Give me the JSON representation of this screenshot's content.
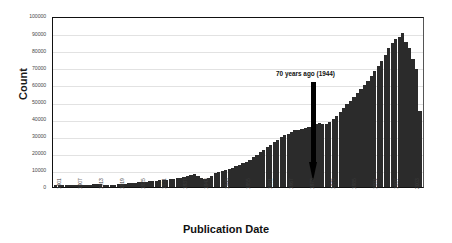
{
  "chart_data": {
    "type": "bar",
    "title": "",
    "xlabel": "Publication Date",
    "ylabel": "Count",
    "ylim": [
      0,
      100000
    ],
    "ytick_labels": [
      "100000",
      "90000",
      "80000",
      "70000",
      "60000",
      "50000",
      "40000",
      "30000",
      "20000",
      "10000",
      "0"
    ],
    "ytick_values": [
      100000,
      90000,
      80000,
      70000,
      60000,
      50000,
      40000,
      30000,
      20000,
      10000,
      0
    ],
    "grid": true,
    "legend": "none",
    "xtick_labels": [
      "1901",
      "1907",
      "1913",
      "1919",
      "1925",
      "1931",
      "1937",
      "1943",
      "1949",
      "1955",
      "1961",
      "1967",
      "1973",
      "1979",
      "1985",
      "1991",
      "1997",
      "2003"
    ],
    "xtick_step": 6,
    "annotations": [
      {
        "text": "70 years ago (1944)",
        "points_to_year": 1944,
        "arrow": "down"
      }
    ],
    "categories": [
      1901,
      1902,
      1903,
      1904,
      1905,
      1906,
      1907,
      1908,
      1909,
      1910,
      1911,
      1912,
      1913,
      1914,
      1915,
      1916,
      1917,
      1918,
      1919,
      1920,
      1921,
      1922,
      1923,
      1924,
      1925,
      1926,
      1927,
      1928,
      1929,
      1930,
      1931,
      1932,
      1933,
      1934,
      1935,
      1936,
      1937,
      1938,
      1939,
      1940,
      1941,
      1942,
      1943,
      1944,
      1945,
      1946,
      1947,
      1948,
      1949,
      1950,
      1951,
      1952,
      1953,
      1954,
      1955,
      1956,
      1957,
      1958,
      1959,
      1960,
      1961,
      1962,
      1963,
      1964,
      1965,
      1966,
      1967,
      1968,
      1969,
      1970,
      1971,
      1972,
      1973,
      1974,
      1975,
      1976,
      1977,
      1978,
      1979,
      1980,
      1981,
      1982,
      1983,
      1984,
      1985,
      1986,
      1987,
      1988,
      1989,
      1990,
      1991,
      1992,
      1993,
      1994,
      1995,
      1996,
      1997,
      1998,
      1999,
      2000,
      2001,
      2002,
      2003,
      2004,
      2005,
      2006
    ],
    "values": [
      1000,
      1050,
      1100,
      1150,
      1200,
      1200,
      1250,
      1300,
      1350,
      1400,
      1450,
      1500,
      1550,
      1500,
      1450,
      1400,
      1400,
      1450,
      1600,
      1800,
      2000,
      2200,
      2400,
      2600,
      2800,
      3000,
      3200,
      3400,
      3600,
      3800,
      4000,
      4200,
      4400,
      4600,
      4900,
      5200,
      5600,
      6000,
      6500,
      7200,
      7500,
      6500,
      5400,
      4700,
      5200,
      6800,
      8200,
      9000,
      9600,
      10200,
      10800,
      11500,
      12200,
      13000,
      14000,
      15000,
      16200,
      17500,
      19000,
      20500,
      22000,
      23500,
      25000,
      26500,
      28000,
      29500,
      30500,
      31500,
      32500,
      33500,
      34000,
      34500,
      35000,
      35500,
      36500,
      37500,
      38000,
      37500,
      37000,
      38500,
      40000,
      42000,
      44500,
      47000,
      49000,
      51000,
      53000,
      55500,
      58000,
      60500,
      63000,
      65500,
      68500,
      71500,
      74500,
      78000,
      82000,
      85000,
      87500,
      89000,
      91000,
      86000,
      82000,
      76000,
      70000,
      45000
    ]
  }
}
